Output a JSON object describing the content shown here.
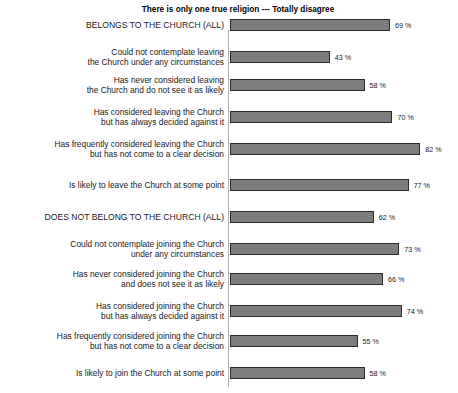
{
  "chart_data": {
    "type": "bar",
    "orientation": "horizontal",
    "title": "There is only one true religion --- Totally disagree",
    "xlabel": "",
    "ylabel": "",
    "xlim": [
      0,
      100
    ],
    "grid": false,
    "legend": null,
    "value_suffix": "%",
    "categories": [
      "BELONGS TO THE CHURCH (ALL)",
      "Could not contemplate leaving\nthe Church under any circumstances",
      "Has never considered leaving\nthe Church and do not see it as likely",
      "Has considered leaving the Church\nbut has always decided against it",
      "Has frequently considered leaving the Church\nbut has not come to a clear decision",
      "Is likely to leave the Church at some point",
      "DOES NOT BELONG TO THE CHURCH (ALL)",
      "Could not contemplate joining the Church\nunder any circumstances",
      "Has never considered joining the Church\nand does not see it as likely",
      "Has considered joining the Church\nbut has always decided against it",
      "Has frequently considered joining the Church\nbut has not come to a clear decision",
      "Is likely to join the Church at some point"
    ],
    "values": [
      69,
      43,
      58,
      70,
      82,
      77,
      62,
      73,
      66,
      74,
      55,
      58
    ],
    "value_labels": [
      "69 %",
      "43 %",
      "58 %",
      "70 %",
      "82 %",
      "77 %",
      "62 %",
      "73 %",
      "66 %",
      "74 %",
      "55 %",
      "58 %"
    ],
    "is_group_header": [
      true,
      false,
      false,
      false,
      false,
      false,
      true,
      false,
      false,
      false,
      false,
      false
    ],
    "colors": {
      "bar_fill": "#7d7d7d",
      "bar_border": "#2b2b2b",
      "axis": "#b4b4b4",
      "text": "#1a1a1a",
      "background": "#ffffff"
    }
  }
}
